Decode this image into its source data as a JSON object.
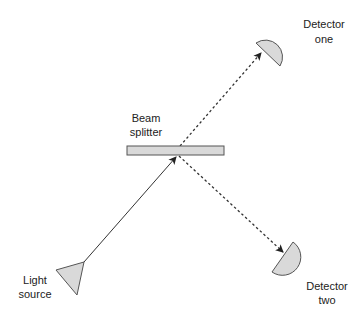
{
  "diagram": {
    "type": "optics-beam-splitter",
    "colors": {
      "component_fill": "#d9d9d9",
      "component_stroke": "#555555",
      "beam": "#333333",
      "text": "#222222",
      "background": "#ffffff"
    },
    "components": {
      "light_source": {
        "label_line1": "Light",
        "label_line2": "source",
        "shape": "triangle"
      },
      "beam_splitter": {
        "label_line1": "Beam",
        "label_line2": "splitter",
        "shape": "rectangle"
      },
      "detector_one": {
        "label_line1": "Detector",
        "label_line2": "one",
        "shape": "half-disc"
      },
      "detector_two": {
        "label_line1": "Detector",
        "label_line2": "two",
        "shape": "half-disc"
      }
    },
    "beams": [
      {
        "from": "light_source",
        "to": "beam_splitter",
        "style": "solid",
        "arrow": true
      },
      {
        "from": "beam_splitter",
        "to": "detector_one",
        "style": "dashed",
        "arrow": true
      },
      {
        "from": "beam_splitter",
        "to": "detector_two",
        "style": "dashed",
        "arrow": true
      }
    ]
  }
}
